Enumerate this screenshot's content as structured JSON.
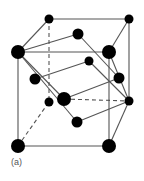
{
  "figure": {
    "label": "(a)",
    "colors": {
      "atom": "#000000",
      "bond": "#555555",
      "background": "#ffffff",
      "label": "#555555"
    }
  },
  "atoms": [
    {
      "id": "back-top-left",
      "x": 49,
      "y": 19,
      "r": 4.5
    },
    {
      "id": "back-top-right",
      "x": 129,
      "y": 19,
      "r": 4.5
    },
    {
      "id": "front-top-left",
      "x": 18,
      "y": 52,
      "r": 7
    },
    {
      "id": "front-top-right",
      "x": 109,
      "y": 52,
      "r": 7
    },
    {
      "id": "inner-top",
      "x": 78,
      "y": 34,
      "r": 5.5
    },
    {
      "id": "inner-upper-mid",
      "x": 89,
      "y": 61,
      "r": 4.5
    },
    {
      "id": "inner-left",
      "x": 35,
      "y": 79,
      "r": 5.5
    },
    {
      "id": "inner-right",
      "x": 119,
      "y": 78,
      "r": 5.5
    },
    {
      "id": "back-bottom-left",
      "x": 49,
      "y": 102,
      "r": 4.5
    },
    {
      "id": "center",
      "x": 64,
      "y": 99,
      "r": 7
    },
    {
      "id": "back-bottom-right",
      "x": 129,
      "y": 101,
      "r": 4.5
    },
    {
      "id": "inner-bottom",
      "x": 77,
      "y": 122,
      "r": 5.5
    },
    {
      "id": "front-bottom-left",
      "x": 18,
      "y": 146,
      "r": 7
    },
    {
      "id": "front-bottom-right",
      "x": 109,
      "y": 146,
      "r": 7
    }
  ],
  "bonds": [
    {
      "x1": 49,
      "y1": 19,
      "x2": 129,
      "y2": 19,
      "dash": false
    },
    {
      "x1": 18,
      "y1": 52,
      "x2": 109,
      "y2": 52,
      "dash": false
    },
    {
      "x1": 18,
      "y1": 52,
      "x2": 49,
      "y2": 19,
      "dash": false
    },
    {
      "x1": 109,
      "y1": 52,
      "x2": 129,
      "y2": 19,
      "dash": false
    },
    {
      "x1": 129,
      "y1": 19,
      "x2": 129,
      "y2": 101,
      "dash": false
    },
    {
      "x1": 18,
      "y1": 52,
      "x2": 18,
      "y2": 146,
      "dash": false
    },
    {
      "x1": 109,
      "y1": 52,
      "x2": 109,
      "y2": 146,
      "dash": false
    },
    {
      "x1": 18,
      "y1": 146,
      "x2": 109,
      "y2": 146,
      "dash": false
    },
    {
      "x1": 109,
      "y1": 146,
      "x2": 129,
      "y2": 101,
      "dash": false
    },
    {
      "x1": 49,
      "y1": 19,
      "x2": 49,
      "y2": 102,
      "dash": true
    },
    {
      "x1": 18,
      "y1": 146,
      "x2": 49,
      "y2": 102,
      "dash": true
    },
    {
      "x1": 64,
      "y1": 99,
      "x2": 129,
      "y2": 101,
      "dash": true
    },
    {
      "x1": 18,
      "y1": 52,
      "x2": 78,
      "y2": 34,
      "dash": false
    },
    {
      "x1": 78,
      "y1": 34,
      "x2": 119,
      "y2": 78,
      "dash": false
    },
    {
      "x1": 35,
      "y1": 79,
      "x2": 89,
      "y2": 61,
      "dash": false
    },
    {
      "x1": 89,
      "y1": 61,
      "x2": 129,
      "y2": 101,
      "dash": false
    },
    {
      "x1": 18,
      "y1": 52,
      "x2": 77,
      "y2": 122,
      "dash": false
    },
    {
      "x1": 18,
      "y1": 52,
      "x2": 64,
      "y2": 99,
      "dash": false
    },
    {
      "x1": 64,
      "y1": 99,
      "x2": 119,
      "y2": 78,
      "dash": false
    },
    {
      "x1": 77,
      "y1": 122,
      "x2": 129,
      "y2": 101,
      "dash": false
    },
    {
      "x1": 109,
      "y1": 52,
      "x2": 129,
      "y2": 101,
      "dash": false
    }
  ]
}
